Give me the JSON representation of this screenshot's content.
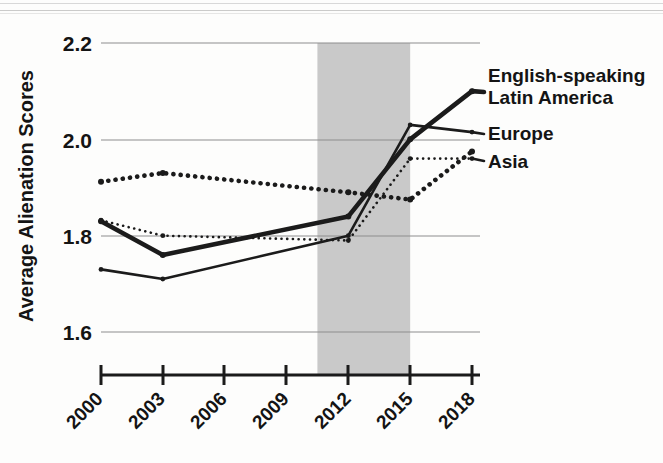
{
  "chart_data": {
    "type": "line",
    "title": "",
    "subtitle": "",
    "xlabel": "",
    "ylabel": "Average Alienation Scores",
    "x": [
      2000,
      2003,
      2006,
      2009,
      2012,
      2015,
      2018
    ],
    "xtick_labels": [
      "2000",
      "2003",
      "2006",
      "2009",
      "2012",
      "2015",
      "2018"
    ],
    "ytick_labels": [
      "1.6",
      "1.8",
      "2.0",
      "2.2"
    ],
    "yticks": [
      1.6,
      1.8,
      2.0,
      2.2
    ],
    "ylim": [
      1.52,
      2.24
    ],
    "xlim": [
      1999.1,
      2018.9
    ],
    "grid": "horizontal",
    "legend_position": "right-of-plot-inline",
    "annotations": [
      {
        "name": "recession-band",
        "label": "",
        "x_start": 2010.5,
        "x_end": 2015.0,
        "color": "#c9c9c9"
      }
    ],
    "series": [
      {
        "name": "English-speaking Latin America",
        "label_lines": [
          "English-speaking",
          "Latin America"
        ],
        "style": "solid",
        "width": "thick",
        "color": "#1b1b1b",
        "x": [
          2000,
          2003,
          2012,
          2015,
          2018
        ],
        "values": [
          1.83,
          1.76,
          1.84,
          2.0,
          2.1
        ]
      },
      {
        "name": "Unlabeled dotted series",
        "label_lines": [],
        "style": "dotted",
        "width": "thick",
        "color": "#1b1b1b",
        "x": [
          2000,
          2003,
          2012,
          2015,
          2018
        ],
        "values": [
          1.912,
          1.93,
          1.89,
          1.875,
          1.975
        ]
      },
      {
        "name": "Europe",
        "label_lines": [
          "Europe"
        ],
        "style": "solid",
        "width": "thin",
        "color": "#1b1b1b",
        "x": [
          2000,
          2003,
          2012,
          2015,
          2018
        ],
        "values": [
          1.73,
          1.71,
          1.8,
          2.03,
          2.015
        ]
      },
      {
        "name": "Asia",
        "label_lines": [
          "Asia"
        ],
        "style": "dotted",
        "width": "thin",
        "color": "#1b1b1b",
        "x": [
          2000,
          2003,
          2012,
          2015,
          2018
        ],
        "values": [
          1.832,
          1.8,
          1.79,
          1.96,
          1.96
        ]
      }
    ]
  },
  "legend": {
    "entries": [
      {
        "line1": "English-speaking",
        "line2": "Latin America"
      },
      {
        "line1": "Europe",
        "line2": ""
      },
      {
        "line1": "Asia",
        "line2": ""
      }
    ]
  },
  "axes": {
    "y_title": "Average Alienation Scores",
    "y_labels": [
      "2.2",
      "2.0",
      "1.8",
      "1.6"
    ],
    "x_labels": [
      "2000",
      "2003",
      "2006",
      "2009",
      "2012",
      "2015",
      "2018"
    ]
  }
}
